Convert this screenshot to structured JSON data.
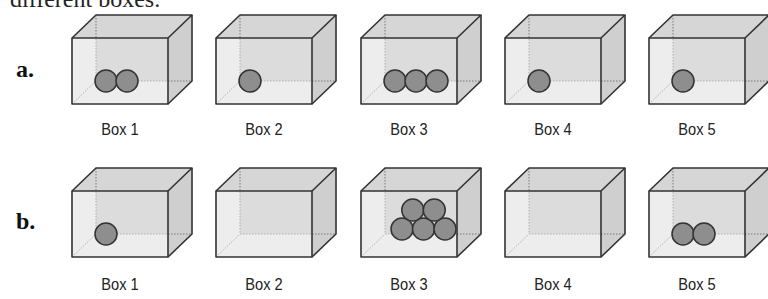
{
  "header": {
    "text": "different boxes."
  },
  "colors": {
    "box_front": "#dedede",
    "box_side": "#cfcfcf",
    "box_top": "#d6d6d6",
    "box_back": "#d9d9d9",
    "edge": "#333333",
    "ball_fill": "#8e8e8e",
    "ball_stroke": "#333333"
  },
  "rows": [
    {
      "label": "a.",
      "boxes": [
        {
          "label": "Box 1",
          "balls": 2,
          "arrangement": "row"
        },
        {
          "label": "Box 2",
          "balls": 1,
          "arrangement": "row"
        },
        {
          "label": "Box 3",
          "balls": 3,
          "arrangement": "row"
        },
        {
          "label": "Box 4",
          "balls": 1,
          "arrangement": "row"
        },
        {
          "label": "Box 5",
          "balls": 1,
          "arrangement": "row"
        }
      ]
    },
    {
      "label": "b.",
      "boxes": [
        {
          "label": "Box 1",
          "balls": 1,
          "arrangement": "row"
        },
        {
          "label": "Box 2",
          "balls": 0,
          "arrangement": "row"
        },
        {
          "label": "Box 3",
          "balls": 5,
          "arrangement": "pyramid"
        },
        {
          "label": "Box 4",
          "balls": 0,
          "arrangement": "row"
        },
        {
          "label": "Box 5",
          "balls": 2,
          "arrangement": "row"
        }
      ]
    }
  ]
}
